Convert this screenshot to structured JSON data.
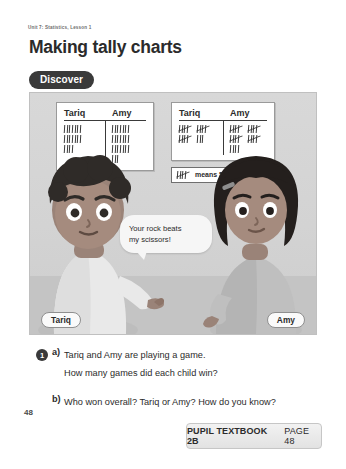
{
  "header": {
    "unit_label": "Unit 7: Statistics, Lesson 1",
    "title": "Making tally charts",
    "section_badge": "Discover"
  },
  "illustration": {
    "chart_left": {
      "columns": [
        "Tariq",
        "Amy"
      ],
      "style": "ungrouped",
      "tariq_rows": [
        7,
        7,
        4
      ],
      "amy_rows": [
        7,
        7,
        7,
        3
      ],
      "tariq_total": 18,
      "amy_total": 24
    },
    "chart_right": {
      "columns": [
        "Tariq",
        "Amy"
      ],
      "style": "grouped-five",
      "tariq_rows": [
        [
          5,
          5
        ],
        [
          5,
          3
        ]
      ],
      "amy_rows": [
        [
          5,
          5
        ],
        [
          5,
          5
        ],
        [
          4
        ]
      ],
      "tariq_total": 18,
      "amy_total": 24
    },
    "legend": {
      "symbol_name": "five-bar-gate-icon",
      "text": "means 5"
    },
    "speech_bubble": {
      "line1": "Your rock beats",
      "line2": "my scissors!"
    },
    "name_tags": {
      "left": "Tariq",
      "right": "Amy"
    }
  },
  "questions": {
    "number": "1",
    "parts": [
      {
        "letter": "a)",
        "lines": [
          "Tariq and Amy are playing a game.",
          "How many games did each child win?"
        ]
      },
      {
        "letter": "b)",
        "lines": [
          "Who won overall? Tariq or Amy? How do you know?"
        ]
      }
    ]
  },
  "page_number": "48",
  "footer": {
    "book": "PUPIL TEXTBOOK 2B",
    "page": "PAGE 48"
  },
  "colors": {
    "ink": "#2b2b2b",
    "badge_bg": "#3a3a3a",
    "panel_bg": "#d5d5d5",
    "card_bg": "#ffffff"
  }
}
